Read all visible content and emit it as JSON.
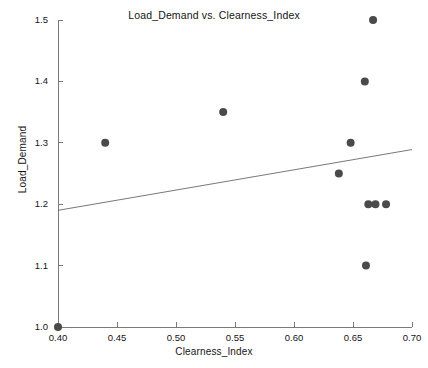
{
  "chart_data": {
    "type": "scatter",
    "title": "Load_Demand vs. Clearness_Index",
    "xlabel": "Clearness_Index",
    "ylabel": "Load_Demand",
    "xlim": [
      0.4,
      0.7
    ],
    "ylim": [
      1.0,
      1.5
    ],
    "xticks": [
      "0.40",
      "0.45",
      "0.50",
      "0.55",
      "0.60",
      "0.65",
      "0.70"
    ],
    "xtick_values": [
      0.4,
      0.45,
      0.5,
      0.55,
      0.6,
      0.65,
      0.7
    ],
    "yticks": [
      "1.0",
      "1.1",
      "1.2",
      "1.3",
      "1.4",
      "1.5"
    ],
    "ytick_values": [
      1.0,
      1.1,
      1.2,
      1.3,
      1.4,
      1.5
    ],
    "grid": false,
    "legend": "none",
    "marker_color": "#4a4a4a",
    "marker_size": 8,
    "points": [
      {
        "x": 0.4,
        "y": 1.0
      },
      {
        "x": 0.44,
        "y": 1.3
      },
      {
        "x": 0.54,
        "y": 1.35
      },
      {
        "x": 0.638,
        "y": 1.25
      },
      {
        "x": 0.648,
        "y": 1.3
      },
      {
        "x": 0.66,
        "y": 1.4
      },
      {
        "x": 0.667,
        "y": 1.5
      },
      {
        "x": 0.663,
        "y": 1.2
      },
      {
        "x": 0.669,
        "y": 1.2
      },
      {
        "x": 0.678,
        "y": 1.2
      },
      {
        "x": 0.661,
        "y": 1.1
      }
    ],
    "trendline": {
      "style": "solid-thin",
      "color": "#555555",
      "x_start": 0.4,
      "y_start": 1.19,
      "x_end": 0.7,
      "y_end": 1.289
    }
  }
}
